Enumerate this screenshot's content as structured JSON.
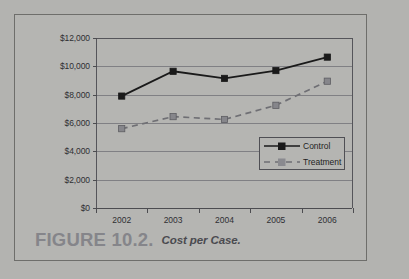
{
  "caption": {
    "figure_label": "FIGURE 10.2.",
    "title": "Cost per Case."
  },
  "chart_data": {
    "type": "line",
    "title": "Cost per Case",
    "xlabel": "",
    "ylabel": "",
    "categories": [
      "2002",
      "2003",
      "2004",
      "2005",
      "2006"
    ],
    "series": [
      {
        "name": "Control",
        "values": [
          7900,
          9650,
          9150,
          9700,
          10650
        ],
        "color": "#1a1a1a",
        "line_style": "solid",
        "marker": "square"
      },
      {
        "name": "Treatment",
        "values": [
          5600,
          6450,
          6250,
          7250,
          8950
        ],
        "color": "#6f6f74",
        "line_style": "dashed",
        "marker": "square"
      }
    ],
    "ylim": [
      0,
      12000
    ],
    "yticks": [
      0,
      2000,
      4000,
      6000,
      8000,
      10000,
      12000
    ],
    "ytick_labels": [
      "$0",
      "$2,000",
      "$4,000",
      "$6,000",
      "$8,000",
      "$10,000",
      "$12,000"
    ],
    "grid": true,
    "legend_position": "inside-right"
  },
  "legend": {
    "entries": [
      {
        "label": "Control"
      },
      {
        "label": "Treatment"
      }
    ]
  },
  "colors": {
    "page_background": "#b3b3b0",
    "frame_border": "#6e6e6b",
    "gridline": "#808084",
    "control": "#1a1a1a",
    "treatment": "#6f6f74",
    "caption_figure": "#85858a",
    "caption_title": "#4a4a4f"
  }
}
